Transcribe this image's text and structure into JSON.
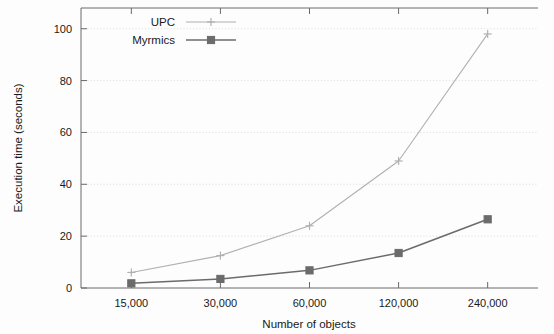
{
  "chart_data": {
    "type": "line",
    "title": "",
    "xlabel": "Number of objects",
    "ylabel": "Execution time (seconds)",
    "categories": [
      "15,000",
      "30,000",
      "60,000",
      "120,000",
      "240,000"
    ],
    "x_values": [
      15000,
      30000,
      60000,
      120000,
      240000
    ],
    "ylim": [
      0,
      108
    ],
    "y_ticks": [
      0,
      20,
      40,
      60,
      80,
      100
    ],
    "y_tick_labels": [
      "0",
      "20",
      "40",
      "60",
      "80",
      "100"
    ],
    "grid": true,
    "grid_axis": "y",
    "legend_position": "top-left",
    "series": [
      {
        "name": "UPC",
        "values": [
          6,
          12.5,
          24,
          49,
          98
        ],
        "color": "#b0b0b0",
        "marker": "plus"
      },
      {
        "name": "Myrmics",
        "values": [
          1.8,
          3.5,
          6.8,
          13.5,
          26.5
        ],
        "color": "#6b6b6b",
        "marker": "square"
      }
    ]
  },
  "legend": {
    "items": [
      {
        "label": "UPC"
      },
      {
        "label": "Myrmics"
      }
    ]
  },
  "colors": {
    "upc": "#b0b0b0",
    "myrmics": "#6b6b6b",
    "axis": "#6a6a6a",
    "grid": "#d8d8d8",
    "text": "#1a1a1a",
    "background": "#fdfdfd"
  }
}
